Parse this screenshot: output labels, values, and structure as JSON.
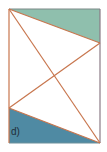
{
  "figure": {
    "label": "d)",
    "colors": {
      "top_region_fill": "#8fbfad",
      "bottom_region_fill": "#4f8aa3",
      "line_color": "#c8764e",
      "frame_color": "#8a7b86"
    },
    "rectangle": {
      "x": 9,
      "y": 9,
      "width": 91,
      "height": 134
    },
    "points": {
      "A": [
        9,
        9
      ],
      "B": [
        100,
        9
      ],
      "C": [
        100,
        143
      ],
      "D": [
        9,
        143
      ],
      "E": [
        100,
        43
      ],
      "F": [
        9,
        108
      ]
    },
    "regions": [
      {
        "name": "top-shaded-triangle",
        "vertices": [
          "A",
          "B",
          "E"
        ]
      },
      {
        "name": "bottom-shaded-triangle",
        "vertices": [
          "F",
          "C",
          "D"
        ]
      }
    ],
    "segments": [
      [
        "A",
        "E"
      ],
      [
        "A",
        "C"
      ],
      [
        "F",
        "E"
      ],
      [
        "F",
        "C"
      ]
    ]
  }
}
